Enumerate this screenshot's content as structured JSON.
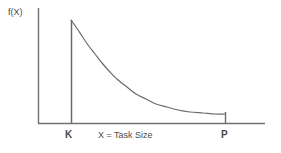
{
  "chart_data": {
    "type": "line",
    "title": "",
    "xlabel": "X = Task Size",
    "ylabel": "f(X)",
    "annotations": [
      "K",
      "P"
    ],
    "grid": false,
    "legend": null,
    "xlim": [
      38,
      265
    ],
    "ylim": [
      123,
      8
    ],
    "markers": {
      "K": {
        "label": "K",
        "x_px": 71,
        "role": "lower-bound"
      },
      "P": {
        "label": "P",
        "x_px": 225,
        "role": "upper-bound"
      }
    },
    "series": [
      {
        "name": "f(X)",
        "color": "#6b6b6b",
        "points": [
          {
            "x": 71,
            "y": 20
          },
          {
            "x": 76,
            "y": 27
          },
          {
            "x": 82,
            "y": 36
          },
          {
            "x": 88,
            "y": 45
          },
          {
            "x": 95,
            "y": 54
          },
          {
            "x": 102,
            "y": 63
          },
          {
            "x": 110,
            "y": 72
          },
          {
            "x": 118,
            "y": 80
          },
          {
            "x": 127,
            "y": 87
          },
          {
            "x": 136,
            "y": 94
          },
          {
            "x": 146,
            "y": 99
          },
          {
            "x": 156,
            "y": 104
          },
          {
            "x": 167,
            "y": 107
          },
          {
            "x": 178,
            "y": 110
          },
          {
            "x": 190,
            "y": 112
          },
          {
            "x": 203,
            "y": 113
          },
          {
            "x": 215,
            "y": 114
          },
          {
            "x": 225,
            "y": 114
          }
        ]
      }
    ]
  },
  "axes": {
    "y_axis_label": "f(X)",
    "x_axis_label": "X = Task Size",
    "tick_k": "K",
    "tick_p": "P"
  },
  "colors": {
    "background": "#ffffff",
    "axis": "#707070",
    "curve": "#6b6b6b",
    "text": "#4a4a4a"
  }
}
